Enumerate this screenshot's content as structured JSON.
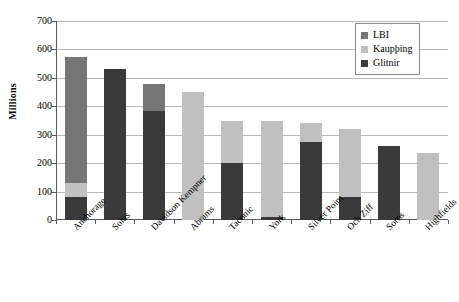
{
  "chart_data": {
    "type": "bar",
    "subtype": "stacked-bar",
    "title": "",
    "xlabel": "",
    "ylabel": "Millions",
    "ylim": [
      0,
      700
    ],
    "ytick_step": 100,
    "ytick_labels": [
      "700",
      "600",
      "500",
      "400",
      "300",
      "200",
      "100",
      "0"
    ],
    "grid": true,
    "legend_position": "top-right",
    "categories": [
      "Anchorage",
      "Solus",
      "Davidson Kempner",
      "Abrams",
      "Taconic",
      "York",
      "Silver Point",
      "Och Ziff",
      "Soros",
      "Highfields"
    ],
    "stack_order_bottom_to_top": [
      "Glitnir",
      "Kaupþing",
      "LBI"
    ],
    "series": [
      {
        "name": "Glitnir",
        "color": "#3a3a3a",
        "values": [
          80,
          530,
          385,
          0,
          200,
          10,
          275,
          80,
          260,
          0
        ]
      },
      {
        "name": "Kaupþing",
        "color": "#c0c0c0",
        "values": [
          50,
          0,
          0,
          450,
          150,
          340,
          65,
          240,
          0,
          235
        ]
      },
      {
        "name": "LBI",
        "color": "#767676",
        "values": [
          445,
          0,
          95,
          0,
          0,
          0,
          0,
          0,
          0,
          0
        ]
      }
    ],
    "totals": [
      575,
      530,
      480,
      450,
      350,
      350,
      340,
      320,
      260,
      235
    ]
  },
  "legend": {
    "entries": [
      {
        "label": "LBI",
        "color": "#767676"
      },
      {
        "label": "Kaupþing",
        "color": "#c0c0c0"
      },
      {
        "label": "Glitnir",
        "color": "#3a3a3a"
      }
    ]
  },
  "colors": {
    "axis": "#5a5a5a",
    "gridline": "#b9b9b9",
    "background": "#ffffff",
    "lbi": "#767676",
    "kaupthing": "#c0c0c0",
    "glitnir": "#3a3a3a"
  }
}
